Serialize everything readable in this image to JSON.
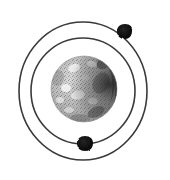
{
  "figure": {
    "title": "Bohr model of an atom",
    "background_color": "#ffffff",
    "width": 170,
    "height": 180
  },
  "nucleus": {
    "label": "nucleus",
    "center_x": 84,
    "center_y": 89,
    "radius": 33,
    "base_color": "#b9b9b9",
    "light_color": "#efefef",
    "shadow_color": "#2a2a2a",
    "highlight_color": "#f7f7f7"
  },
  "orbits": [
    {
      "label": "inner-orbit",
      "center_x": 83,
      "center_y": 91,
      "radius_x": 52,
      "radius_y": 53,
      "stroke_color": "#3a3a3a",
      "stroke_width": 1.6
    },
    {
      "label": "outer-orbit",
      "center_x": 83,
      "center_y": 91,
      "radius_x": 64,
      "radius_y": 69,
      "stroke_color": "#3a3a3a",
      "stroke_width": 1.6
    }
  ],
  "electrons": [
    {
      "label": "electron-outer-upper-right",
      "center_x": 125,
      "center_y": 31,
      "radius": 7,
      "color": "#111111",
      "on_orbit": "outer-orbit"
    },
    {
      "label": "electron-inner-bottom",
      "center_x": 85,
      "center_y": 143,
      "radius": 7,
      "color": "#111111",
      "on_orbit": "inner-orbit"
    }
  ]
}
